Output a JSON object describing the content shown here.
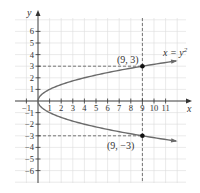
{
  "chart_data": {
    "type": "line",
    "title": "",
    "xlabel": "x",
    "ylabel": "y",
    "xlim": [
      -2,
      12.7
    ],
    "ylim": [
      -7,
      7.2
    ],
    "grid": true,
    "x_ticks": [
      -1,
      1,
      2,
      3,
      4,
      5,
      6,
      7,
      8,
      9,
      10,
      11
    ],
    "x_tick_labels": [
      "-1",
      "1",
      "2",
      "3",
      "4",
      "5",
      "6",
      "7",
      "8",
      "9",
      "10",
      "11"
    ],
    "y_ticks": [
      6,
      5,
      4,
      3,
      2,
      1,
      -1,
      -2,
      -3,
      -4,
      -5,
      -6
    ],
    "y_tick_labels": [
      "6",
      "5",
      "4",
      "3",
      "2",
      "1",
      "-1",
      "-2",
      "-3",
      "-4",
      "-5",
      "-6"
    ],
    "series": [
      {
        "name": "x = y^2",
        "equation": "x = y²",
        "color": "#6b6b6b",
        "y_range": [
          -3.5,
          3.5
        ],
        "x": [
          12.25,
          9,
          6.25,
          4,
          2.25,
          1,
          0.25,
          0,
          0.25,
          1,
          2.25,
          4,
          6.25,
          9,
          12.25
        ],
        "y": [
          -3.5,
          -3,
          -2.5,
          -2,
          -1.5,
          -1,
          -0.5,
          0,
          0.5,
          1,
          1.5,
          2,
          2.5,
          3,
          3.5
        ]
      }
    ],
    "annotations": [
      {
        "type": "point",
        "x": 9,
        "y": 3,
        "label": "(9, 3)"
      },
      {
        "type": "point",
        "x": 9,
        "y": -3,
        "label": "(9, −3)"
      },
      {
        "type": "dashed-vline",
        "x": 9
      },
      {
        "type": "dashed-hline",
        "y": 3,
        "from_x": 0,
        "to_x": 9
      },
      {
        "type": "dashed-hline",
        "y": -3,
        "from_x": 0,
        "to_x": 9
      },
      {
        "type": "curve-label",
        "text": "x = y²",
        "near": [
          11.5,
          4
        ]
      }
    ],
    "colors": {
      "grid": "#dcdcdc",
      "axis": "#333333",
      "curve": "#6b6b6b",
      "point": "#111111",
      "dashed": "#555555"
    }
  },
  "labels": {
    "x_axis": "x",
    "y_axis": "y",
    "point_upper": "(9, 3)",
    "point_lower": "(9, −3)",
    "equation_x": "x = y",
    "equation_exp": "2"
  }
}
